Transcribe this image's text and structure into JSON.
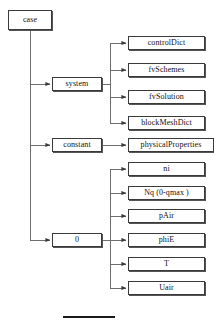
{
  "diagram": {
    "title": "case",
    "type": "tree",
    "root": {
      "label": "case",
      "x": 8,
      "y": 10,
      "w": 44,
      "h": 20
    },
    "mid_nodes": [
      {
        "label": "system",
        "x": 52,
        "y": 77,
        "w": 50,
        "h": 14
      },
      {
        "label": "constant",
        "x": 52,
        "y": 138,
        "w": 50,
        "h": 14
      },
      {
        "label": "0",
        "x": 52,
        "y": 233,
        "w": 50,
        "h": 14
      }
    ],
    "leaf_groups": [
      {
        "parent": "system",
        "leaves": [
          {
            "label": "controlDict",
            "x": 128,
            "y": 36,
            "w": 77,
            "h": 14
          },
          {
            "label": "fvSchemes",
            "x": 128,
            "y": 63,
            "w": 77,
            "h": 14
          },
          {
            "label": "fvSolution",
            "x": 128,
            "y": 90,
            "w": 77,
            "h": 14
          },
          {
            "label": "blockMeshDict",
            "x": 128,
            "y": 116,
            "w": 77,
            "h": 14
          }
        ]
      },
      {
        "parent": "constant",
        "leaves": [
          {
            "label": "physicalProperties",
            "x": 128,
            "y": 138,
            "w": 86,
            "h": 14
          }
        ]
      },
      {
        "parent": "0",
        "leaves": [
          {
            "label": "ni",
            "x": 128,
            "y": 162,
            "w": 77,
            "h": 14
          },
          {
            "label": "Nq (0-qmax )",
            "x": 128,
            "y": 186,
            "w": 77,
            "h": 14
          },
          {
            "label": "pAir",
            "x": 128,
            "y": 209,
            "w": 77,
            "h": 14
          },
          {
            "label": "phiE",
            "x": 128,
            "y": 233,
            "w": 77,
            "h": 14
          },
          {
            "label": "T",
            "x": 128,
            "y": 257,
            "w": 77,
            "h": 14
          },
          {
            "label": "Uair",
            "x": 128,
            "y": 281,
            "w": 77,
            "h": 14
          }
        ]
      }
    ],
    "colors": {
      "line": "#6f6f6f",
      "border": "#3a3a3a",
      "shadow": "#555555",
      "text": "#111111",
      "background": "#ffffff"
    },
    "connectors": {
      "trunk_x": 30,
      "branch_x": 110,
      "arrowhead": "filled-triangle-right"
    },
    "footer_rule": {
      "x": 63,
      "y": 316,
      "w": 52,
      "h": 2
    }
  }
}
